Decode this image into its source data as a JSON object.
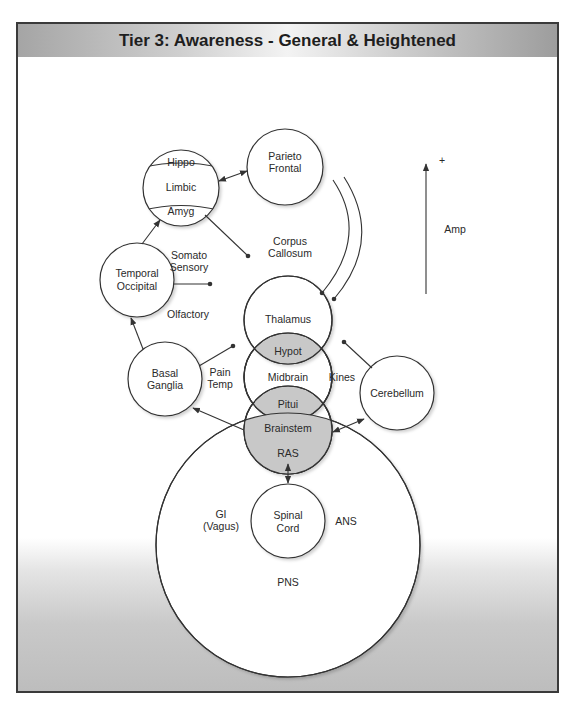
{
  "header": {
    "title": "Tier 3: Awareness - General & Heightened"
  },
  "top_fragment": "~~~",
  "diagram": {
    "nodes": {
      "limbic": {
        "label": "Limbic",
        "top_cap": "Hippo",
        "bottom_cap": "Amyg"
      },
      "parieto_frontal": {
        "line1": "Parieto",
        "line2": "Frontal"
      },
      "temporal_occipital": {
        "line1": "Temporal",
        "line2": "Occipital"
      },
      "basal_ganglia": {
        "line1": "Basal",
        "line2": "Ganglia"
      },
      "thalamus": {
        "label": "Thalamus"
      },
      "hypot": {
        "label": "Hypot"
      },
      "midbrain": {
        "label": "Midbrain"
      },
      "pitui": {
        "label": "Pitui"
      },
      "brainstem": {
        "label": "Brainstem"
      },
      "ras": {
        "label": "RAS"
      },
      "cerebellum": {
        "label": "Cerebellum"
      },
      "spinal_cord": {
        "line1": "Spinal",
        "line2": "Cord"
      },
      "pns": {
        "label": "PNS"
      }
    },
    "labels": {
      "corpus_callosum": {
        "line1": "Corpus",
        "line2": "Callosum"
      },
      "somato_sensory": {
        "line1": "Somato",
        "line2": "Sensory"
      },
      "olfactory": "Olfactory",
      "pain_temp": {
        "line1": "Pain",
        "line2": "Temp"
      },
      "kines": "Kines",
      "gi_vagus": {
        "line1": "GI",
        "line2": "(Vagus)"
      },
      "ans": "ANS",
      "amp": "Amp",
      "plus": "+"
    },
    "colors": {
      "stroke": "#333333",
      "overlap_fill": "#c8c8c8",
      "node_fill": "#ffffff"
    }
  }
}
